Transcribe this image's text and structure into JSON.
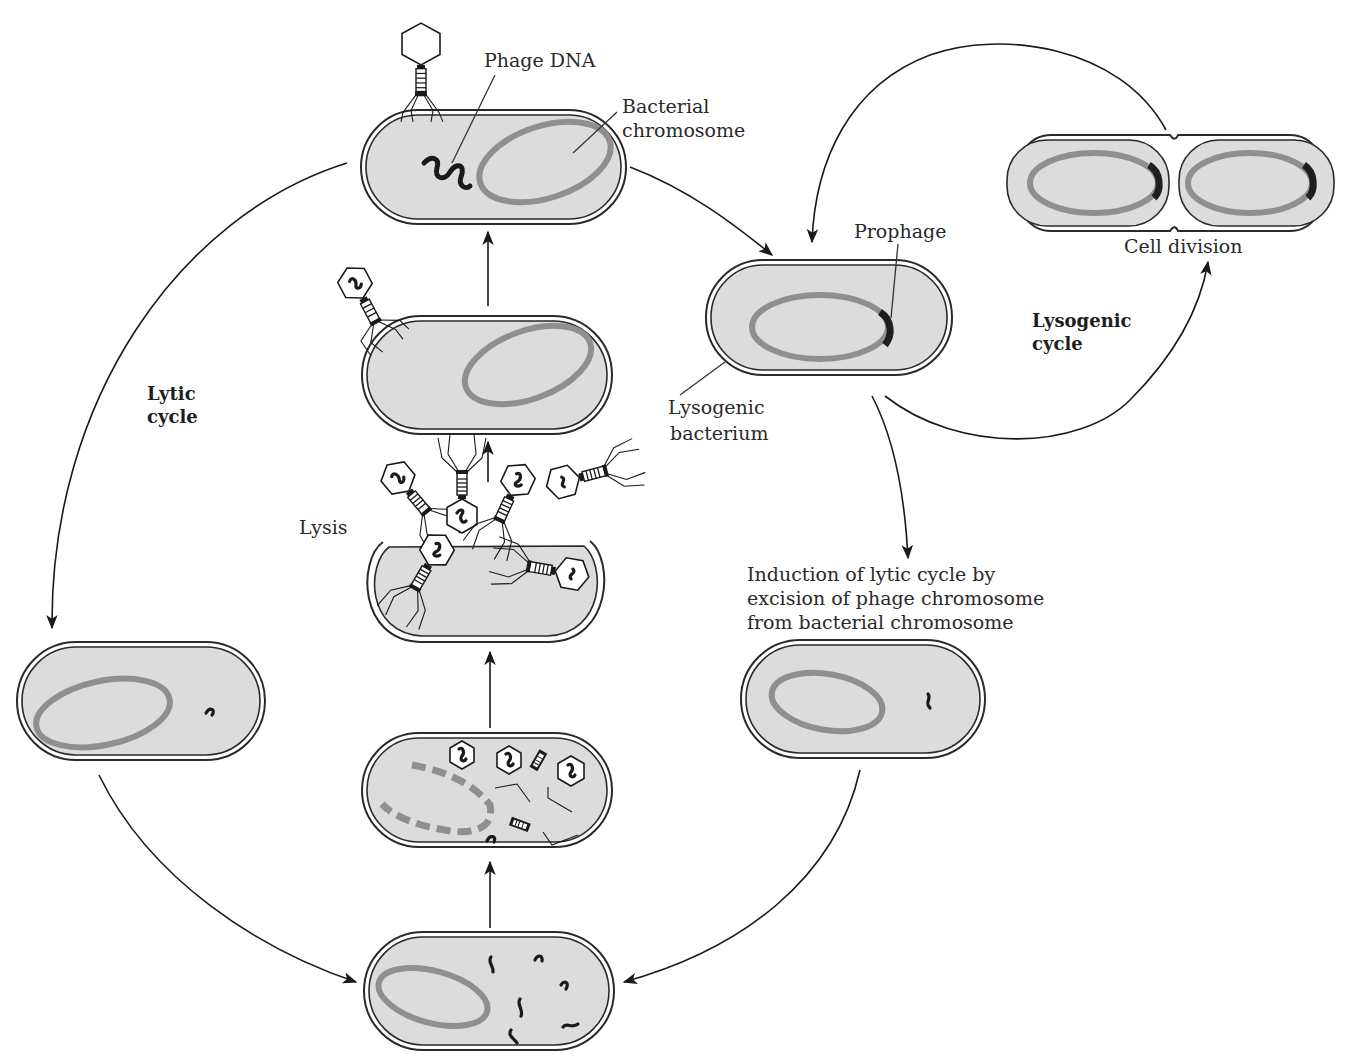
{
  "labels": {
    "phage_dna": "Phage DNA",
    "bacterial_chromosome_line1": "Bacterial",
    "bacterial_chromosome_line2": "chromosome",
    "prophage": "Prophage",
    "cell_division": "Cell division",
    "lysogenic_cycle_line1": "Lysogenic",
    "lysogenic_cycle_line2": "cycle",
    "lytic_cycle_line1": "Lytic",
    "lytic_cycle_line2": "cycle",
    "lysis": "Lysis",
    "lysogenic_bacterium_line1": "Lysogenic",
    "lysogenic_bacterium_line2": "bacterium",
    "induction_line1": "Induction of lytic cycle by",
    "induction_line2": "excision of phage chromosome",
    "induction_line3": "from bacterial chromosome"
  },
  "stages": [
    {
      "id": "infection",
      "description": "Phage attaches and injects DNA into bacterium"
    },
    {
      "id": "lysogenic-bacterium",
      "description": "Phage DNA integrated as prophage"
    },
    {
      "id": "cell-division",
      "description": "Lysogenic bacterium divides, copying prophage"
    },
    {
      "id": "induction",
      "description": "Prophage excised from bacterial chromosome"
    },
    {
      "id": "circularized-phage-dna",
      "description": "Phage DNA free in cytoplasm (lytic path)"
    },
    {
      "id": "replication",
      "description": "Phage DNA replicates"
    },
    {
      "id": "assembly",
      "description": "Host chromosome degraded; phage parts assembled"
    },
    {
      "id": "lysis",
      "description": "Cell bursts, releasing new phages"
    },
    {
      "id": "new-infection",
      "description": "Released phage attaches to a new bacterium"
    }
  ],
  "colors": {
    "cytoplasm": "#dcdcdc",
    "chromosome": "#8f8f8f",
    "prophage": "#1e1e1e",
    "outline": "#2a2a2a"
  }
}
